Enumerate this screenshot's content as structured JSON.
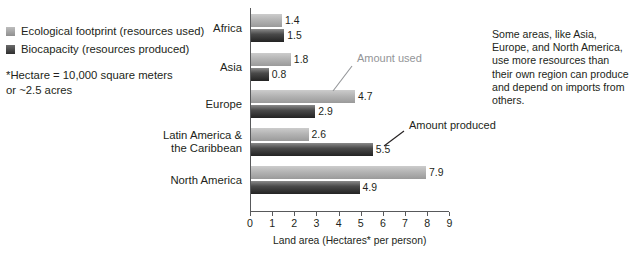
{
  "legend": {
    "items": [
      {
        "label": "Ecological footprint (resources used)",
        "swatch": "light",
        "color": "#b4b4b4"
      },
      {
        "label": "Biocapacity (resources produced)",
        "swatch": "dark",
        "color": "#3a3a3a"
      }
    ]
  },
  "footnote": {
    "line1": "*Hectare = 10,000 square meters",
    "line2": "or ~2.5 acres"
  },
  "commentary": {
    "text": "Some areas, like Asia, Europe, and North America, use more resources than their own region can produce and depend on imports from others."
  },
  "annotations": [
    {
      "id": "amount-used",
      "label": "Amount used",
      "color": "#939598"
    },
    {
      "id": "amount-produced",
      "label": "Amount produced",
      "color": "#231f20"
    }
  ],
  "chart_data": {
    "type": "bar",
    "orientation": "horizontal",
    "title": "",
    "xlabel": "Land area (Hectares* per person)",
    "ylabel": "",
    "xlim": [
      0,
      9
    ],
    "xticks": [
      0,
      1,
      2,
      3,
      4,
      5,
      6,
      7,
      8,
      9
    ],
    "xtick_labels": [
      "0",
      "1",
      "2",
      "3",
      "4",
      "5",
      "6",
      "7",
      "8",
      "9"
    ],
    "grid": false,
    "legend_position": "top-left",
    "categories": [
      "Africa",
      "Asia",
      "Europe",
      "Latin America & the Caribbean",
      "North America"
    ],
    "category_lines": [
      [
        "Africa"
      ],
      [
        "Asia"
      ],
      [
        "Europe"
      ],
      [
        "Latin America &",
        "the Caribbean"
      ],
      [
        "North America"
      ]
    ],
    "series": [
      {
        "name": "Ecological footprint (resources used)",
        "color": "#b4b4b4",
        "values": [
          1.4,
          1.8,
          4.7,
          2.6,
          7.9
        ]
      },
      {
        "name": "Biocapacity (resources produced)",
        "color": "#3a3a3a",
        "values": [
          1.5,
          0.8,
          2.9,
          5.5,
          4.9
        ]
      }
    ]
  }
}
